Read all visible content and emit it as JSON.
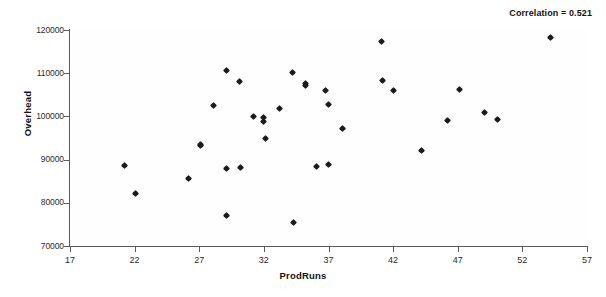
{
  "chart_data": {
    "type": "scatter",
    "title": "",
    "xlabel": "ProdRuns",
    "ylabel": "Overhead",
    "xlim": [
      17,
      57
    ],
    "ylim": [
      70000,
      120000
    ],
    "xticks": [
      17,
      22,
      27,
      32,
      37,
      42,
      47,
      52,
      57
    ],
    "yticks": [
      70000,
      80000,
      90000,
      100000,
      110000,
      120000
    ],
    "xtick_labels": [
      "17",
      "22",
      "27",
      "32",
      "37",
      "42",
      "47",
      "52",
      "57"
    ],
    "ytick_labels": [
      "70000",
      "80000",
      "90000",
      "100000",
      "110000",
      "120000"
    ],
    "grid": false,
    "legend": null,
    "annotations": [
      {
        "name": "correlation-annotation",
        "text": "Correlation = 0.521",
        "position": "top-right"
      }
    ],
    "marker": "diamond",
    "marker_color": "#1b1b1b",
    "points": [
      {
        "x": 21.2,
        "y": 88700
      },
      {
        "x": 22.1,
        "y": 82200
      },
      {
        "x": 26.2,
        "y": 85700
      },
      {
        "x": 27.1,
        "y": 93500
      },
      {
        "x": 27.1,
        "y": 93200
      },
      {
        "x": 28.1,
        "y": 102600
      },
      {
        "x": 29.1,
        "y": 110600
      },
      {
        "x": 29.1,
        "y": 88000
      },
      {
        "x": 29.1,
        "y": 77000
      },
      {
        "x": 30.1,
        "y": 108100
      },
      {
        "x": 30.2,
        "y": 88200
      },
      {
        "x": 31.2,
        "y": 100000
      },
      {
        "x": 32.0,
        "y": 99800
      },
      {
        "x": 32.0,
        "y": 98900
      },
      {
        "x": 32.1,
        "y": 94900
      },
      {
        "x": 33.2,
        "y": 101900
      },
      {
        "x": 34.2,
        "y": 110100
      },
      {
        "x": 34.3,
        "y": 75400
      },
      {
        "x": 35.2,
        "y": 107700
      },
      {
        "x": 35.2,
        "y": 107100
      },
      {
        "x": 36.1,
        "y": 88500
      },
      {
        "x": 36.8,
        "y": 105900
      },
      {
        "x": 37.0,
        "y": 102700
      },
      {
        "x": 37.0,
        "y": 88800
      },
      {
        "x": 38.1,
        "y": 97100
      },
      {
        "x": 41.1,
        "y": 117400
      },
      {
        "x": 41.2,
        "y": 108300
      },
      {
        "x": 42.0,
        "y": 105900
      },
      {
        "x": 44.2,
        "y": 92100
      },
      {
        "x": 46.2,
        "y": 99000
      },
      {
        "x": 47.1,
        "y": 106200
      },
      {
        "x": 49.1,
        "y": 100900
      },
      {
        "x": 50.1,
        "y": 99200
      },
      {
        "x": 54.2,
        "y": 118200
      }
    ]
  }
}
